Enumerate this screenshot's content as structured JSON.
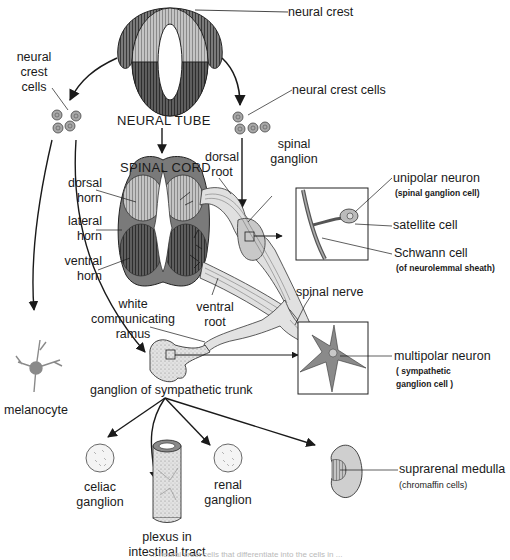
{
  "diagram": {
    "type": "developmental flow diagram",
    "colors": {
      "background": "#ffffff",
      "ink": "#1a1a1a",
      "dark_gray": "#6e6e6e",
      "mid_gray": "#9a9a9a",
      "light_gray": "#cfcfcf",
      "pale_gray": "#e4e4e4"
    }
  },
  "labels": {
    "neural_crest": "neural crest",
    "neural_crest_cells_left": [
      "neural",
      "crest",
      "cells"
    ],
    "neural_crest_cells_right": "neural crest cells",
    "neural_tube": "NEURAL TUBE",
    "spinal_cord": "SPINAL CORD",
    "dorsal_root": [
      "dorsal",
      "root"
    ],
    "spinal_ganglion": [
      "spinal",
      "ganglion"
    ],
    "dorsal_horn": [
      "dorsal",
      "horn"
    ],
    "lateral_horn": [
      "lateral",
      "horn"
    ],
    "ventral_horn": [
      "ventral",
      "horn"
    ],
    "unipolar_neuron": "unipolar neuron",
    "unipolar_neuron_sub": "(spinal ganglion cell)",
    "satellite_cell": "satellite cell",
    "schwann_cell": "Schwann cell",
    "schwann_cell_sub": "(of neurolemmal sheath)",
    "spinal_nerve": "spinal nerve",
    "white_ramus": [
      "white",
      "communicating",
      "ramus"
    ],
    "ventral_root": [
      "ventral",
      "root"
    ],
    "multipolar_neuron": "multipolar neuron",
    "multipolar_neuron_sub": [
      "( sympathetic",
      "ganglion cell )"
    ],
    "melanocyte": "melanocyte",
    "sympathetic_ganglion": "ganglion of sympathetic trunk",
    "celiac_ganglion": [
      "celiac",
      "ganglion"
    ],
    "renal_ganglion": [
      "renal",
      "ganglion"
    ],
    "intestinal_plexus": [
      "plexus in",
      "intestinal tract"
    ],
    "suprarenal_medulla": "suprarenal medulla",
    "suprarenal_medulla_sub": "(chromaffin cells)"
  },
  "caption_partial": "... neural crest cells that differentiate into the cells in ..."
}
